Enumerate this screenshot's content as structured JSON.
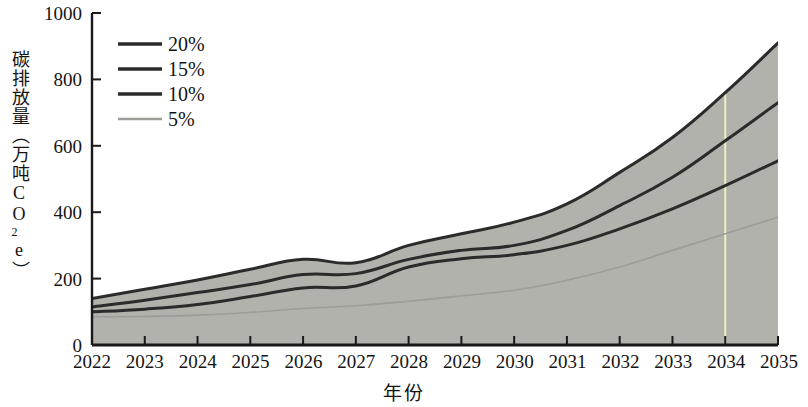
{
  "chart_data": {
    "type": "line",
    "title": "",
    "xlabel": "年份",
    "ylabel": "碳排放量（万吨CO2e）",
    "ylabel_parts": {
      "before": "碳排放量（万吨CO",
      "sub": "2",
      "after": "e）"
    },
    "x": [
      2022,
      2023,
      2024,
      2025,
      2026,
      2027,
      2028,
      2029,
      2030,
      2031,
      2032,
      2033,
      2034,
      2035
    ],
    "categories": [
      "2022",
      "2023",
      "2024",
      "2025",
      "2026",
      "2027",
      "2028",
      "2029",
      "2030",
      "2031",
      "2032",
      "2033",
      "2034",
      "2035"
    ],
    "xlim": [
      2022,
      2035
    ],
    "ylim": [
      0,
      1000
    ],
    "yticks": [
      0,
      200,
      400,
      600,
      800,
      1000
    ],
    "ytick_labels": [
      "0",
      "200",
      "400",
      "600",
      "800",
      "1000"
    ],
    "grid": false,
    "legend_position": "upper left",
    "fill_between": "5% to 20% band shaded gray",
    "fill_color": "#b2b2ac",
    "annotation_line": {
      "type": "vertical",
      "x": 2034,
      "color": "#f2f0c0"
    },
    "series": [
      {
        "name": "20%",
        "color": "#2b2b2b",
        "values": [
          140,
          168,
          196,
          228,
          258,
          248,
          300,
          335,
          370,
          425,
          520,
          625,
          760,
          910
        ]
      },
      {
        "name": "15%",
        "color": "#2b2b2b",
        "values": [
          115,
          135,
          158,
          182,
          212,
          215,
          258,
          285,
          300,
          345,
          420,
          505,
          615,
          730
        ]
      },
      {
        "name": "10%",
        "color": "#2b2b2b",
        "values": [
          100,
          108,
          122,
          146,
          172,
          178,
          235,
          260,
          272,
          300,
          350,
          410,
          480,
          555
        ]
      },
      {
        "name": "5%",
        "color": "#9c9c98",
        "values": [
          85,
          86,
          90,
          98,
          110,
          118,
          132,
          148,
          165,
          195,
          235,
          285,
          335,
          385
        ]
      }
    ]
  },
  "legend": {
    "items": [
      {
        "label": "20%",
        "color": "#2b2b2b"
      },
      {
        "label": "15%",
        "color": "#2b2b2b"
      },
      {
        "label": "10%",
        "color": "#2b2b2b"
      },
      {
        "label": "5%",
        "color": "#9c9c98"
      }
    ]
  },
  "axis": {
    "x_title": "年份",
    "y_tick_0": "0",
    "y_tick_1": "200",
    "y_tick_2": "400",
    "y_tick_3": "600",
    "y_tick_4": "800",
    "y_tick_5": "1000",
    "x_tick_0": "2022",
    "x_tick_1": "2023",
    "x_tick_2": "2024",
    "x_tick_3": "2025",
    "x_tick_4": "2026",
    "x_tick_5": "2027",
    "x_tick_6": "2028",
    "x_tick_7": "2029",
    "x_tick_8": "2030",
    "x_tick_9": "2031",
    "x_tick_10": "2032",
    "x_tick_11": "2033",
    "x_tick_12": "2034",
    "x_tick_13": "2035"
  }
}
